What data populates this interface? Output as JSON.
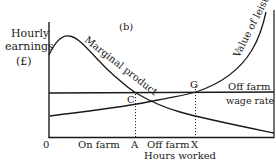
{
  "diagram": {
    "panel_label": "(b)",
    "y_axis": {
      "label_line1": "Hourly",
      "label_line2": "earnings",
      "label_line3": "(£)"
    },
    "x_axis": {
      "label": "Hours worked",
      "origin": "0",
      "tick_labels": [
        "A",
        "X"
      ],
      "region_labels": [
        "On farm",
        "Off farm"
      ]
    },
    "curves": {
      "marginal_product": "Marginal product",
      "value_of_leisure": "Value of leisure",
      "wage_rate_line1": "Off farm",
      "wage_rate_line2": "wage rate"
    },
    "points": {
      "c": "C",
      "g": "G"
    },
    "colors": {
      "ink": "#1a1a1a",
      "background": "#ffffff"
    }
  }
}
